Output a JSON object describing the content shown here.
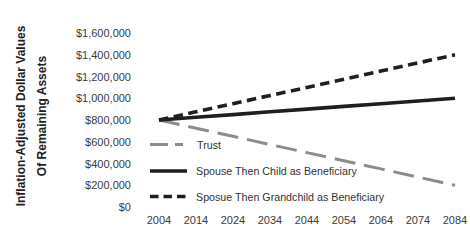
{
  "chart_data": {
    "type": "line",
    "title": "",
    "ylabel_line1": "Inflation-Adjusted Dollar Values",
    "ylabel_line2": "Of Remaining Assets",
    "x_ticks": [
      "2004",
      "2014",
      "2024",
      "2034",
      "2044",
      "2054",
      "2064",
      "2074",
      "2084"
    ],
    "y_ticks": [
      "$1,600,000",
      "$1,400,000",
      "$1,200,000",
      "$1,000,000",
      "$800,000",
      "$600,000",
      "$400,000",
      "$200,000",
      "$0"
    ],
    "ylim": [
      0,
      1600000
    ],
    "y_tick_step": 200000,
    "grid": false,
    "legend_position": "inside-left-middle",
    "series": [
      {
        "name": "Trust",
        "color": "#8c8c8c",
        "line_style": "long-dash",
        "width": 3,
        "dash": "21 9",
        "swatch_dash": "18 7",
        "values": [
          800000,
          725000,
          650000,
          575000,
          500000,
          425000,
          350000,
          275000,
          200000
        ]
      },
      {
        "name": "Spouse Then Child as Beneficiary",
        "color": "#1f1f1f",
        "line_style": "solid",
        "width": 3.6,
        "dash": null,
        "swatch_dash": null,
        "values": [
          800000,
          825000,
          850000,
          875000,
          900000,
          925000,
          950000,
          975000,
          1000000
        ]
      },
      {
        "name": "Sposue Then Grandchild as Beneficiary",
        "color": "#1f1f1f",
        "line_style": "dash",
        "width": 3.6,
        "dash": "9.5 5.5",
        "swatch_dash": "8.5 5",
        "values": [
          800000,
          875000,
          950000,
          1025000,
          1100000,
          1175000,
          1250000,
          1325000,
          1400000
        ]
      }
    ]
  }
}
